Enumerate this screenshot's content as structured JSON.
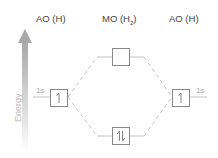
{
  "headers": {
    "left": "AO (H)",
    "middle_main": "MO (H",
    "middle_sub": "2",
    "middle_close": ")",
    "right": "AO (H)"
  },
  "axis": {
    "label": "Energy"
  },
  "orbitals": {
    "left": {
      "label": "1s",
      "electrons": "↿"
    },
    "right": {
      "label": "1s",
      "electrons": "↿"
    },
    "antibonding": {
      "electrons": ""
    },
    "bonding": {
      "electrons": "⥮"
    }
  },
  "colors": {
    "box": "#888888",
    "line": "#bbbbbb",
    "arrow": "#aaaaaa"
  }
}
